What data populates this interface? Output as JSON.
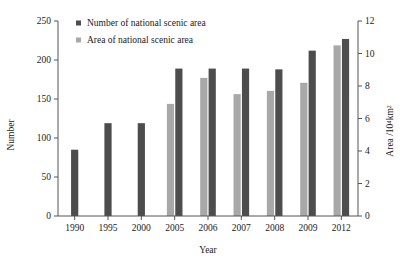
{
  "chart_data": {
    "type": "bar",
    "title": "",
    "xlabel": "Year",
    "ylabel": "Number",
    "y2label": "Area /10⁴km²",
    "categories": [
      "1990",
      "1995",
      "2000",
      "2005",
      "2006",
      "2007",
      "2008",
      "2009",
      "2012"
    ],
    "series": [
      {
        "name": "Number of national scenic area",
        "axis": "left",
        "color": "#4d4d4d",
        "values": [
          85,
          119,
          119,
          189,
          189,
          189,
          188,
          212,
          227
        ]
      },
      {
        "name": "Area of national scenic area",
        "axis": "right",
        "color": "#a8a8a8",
        "values": [
          null,
          null,
          null,
          6.9,
          8.5,
          7.5,
          7.7,
          8.2,
          10.5
        ]
      }
    ],
    "ylim": [
      0,
      250
    ],
    "yticks": [
      0,
      50,
      100,
      150,
      200,
      250
    ],
    "y2lim": [
      0,
      12
    ],
    "y2ticks": [
      0,
      2,
      4,
      6,
      8,
      10,
      12
    ],
    "grid": false,
    "legend_position": "top-left-inside"
  },
  "legend": {
    "items": [
      {
        "label": "Number of national scenic area",
        "color": "#4d4d4d"
      },
      {
        "label": "Area of national scenic area",
        "color": "#a8a8a8"
      }
    ]
  },
  "axes": {
    "left_title": "Number",
    "right_title": "Area /10⁴km²",
    "bottom_title": "Year"
  }
}
